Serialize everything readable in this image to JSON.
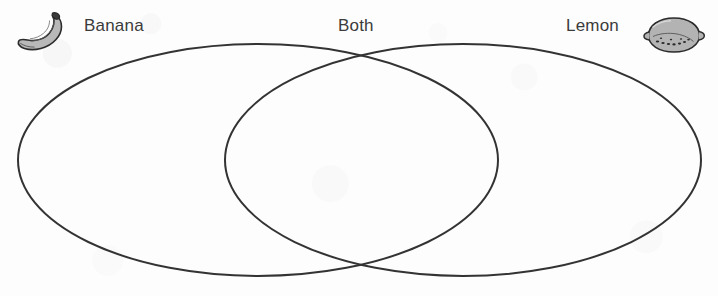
{
  "worksheet": {
    "type": "venn-diagram",
    "title": "Banana and Lemon Venn Diagram",
    "background_color": "#fdfdfd",
    "stroke_color": "#333333",
    "text_color": "#3b3b3b"
  },
  "labels": {
    "left": "Banana",
    "center": "Both",
    "right": "Lemon"
  },
  "icons": {
    "left": "banana-icon",
    "right": "lemon-icon",
    "fill_color": "#b3b3b3",
    "outline_color": "#2b2b2b",
    "stem_color": "#3a3a3a"
  },
  "diagram": {
    "left_circle": {
      "name": "Banana",
      "cx": 258,
      "cy": 160,
      "rx": 240,
      "ry": 116
    },
    "right_circle": {
      "name": "Lemon",
      "cx": 463,
      "cy": 160,
      "rx": 238,
      "ry": 116
    },
    "intersection_label": "Both",
    "stroke_width": 2,
    "fill": "none",
    "entries": {
      "left_only": [],
      "overlap": [],
      "right_only": []
    }
  }
}
